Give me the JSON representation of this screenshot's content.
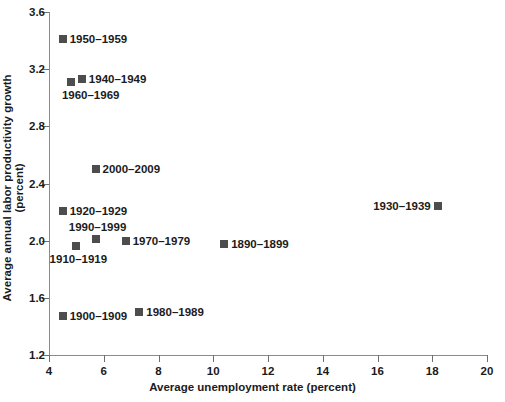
{
  "chart_data": {
    "type": "scatter",
    "title": "",
    "xlabel": "Average unemployment rate (percent)",
    "ylabel": "Average annual labor productivity growth (percent)",
    "xlim": [
      4,
      20
    ],
    "ylim": [
      1.2,
      3.6
    ],
    "xticks": [
      "4",
      "6",
      "8",
      "10",
      "12",
      "14",
      "16",
      "18",
      "20"
    ],
    "yticks": [
      "1.2",
      "1.6",
      "2.0",
      "2.4",
      "2.8",
      "3.2",
      "3.6"
    ],
    "grid": false,
    "legend": "none",
    "marker_color": "#4d4d4d",
    "axis_color": "#8a8a8a",
    "points": [
      {
        "label": "1950–1959",
        "x": 4.5,
        "y": 3.41,
        "label_side": "right"
      },
      {
        "label": "1940–1949",
        "x": 5.2,
        "y": 3.13,
        "label_side": "right"
      },
      {
        "label": "1960–1969",
        "x": 4.8,
        "y": 3.11,
        "label_side": "below-left"
      },
      {
        "label": "2000–2009",
        "x": 5.7,
        "y": 2.5,
        "label_side": "right"
      },
      {
        "label": "1930–1939",
        "x": 18.2,
        "y": 2.24,
        "label_side": "left"
      },
      {
        "label": "1920–1929",
        "x": 4.5,
        "y": 2.21,
        "label_side": "right"
      },
      {
        "label": "1990–1999",
        "x": 5.7,
        "y": 2.01,
        "label_side": "above"
      },
      {
        "label": "1970–1979",
        "x": 6.8,
        "y": 2.0,
        "label_side": "right"
      },
      {
        "label": "1890–1899",
        "x": 10.4,
        "y": 1.98,
        "label_side": "right"
      },
      {
        "label": "1910–1919",
        "x": 5.0,
        "y": 1.96,
        "label_side": "below"
      },
      {
        "label": "1980–1989",
        "x": 7.3,
        "y": 1.5,
        "label_side": "right"
      },
      {
        "label": "1900–1909",
        "x": 4.5,
        "y": 1.47,
        "label_side": "right"
      }
    ]
  }
}
